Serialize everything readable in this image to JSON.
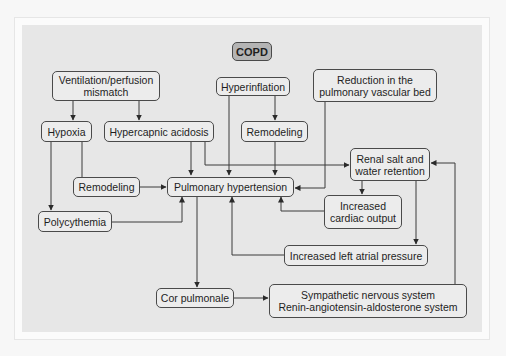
{
  "diagram": {
    "title": "COPD",
    "nodes": {
      "copd": {
        "label": "COPD"
      },
      "vq": {
        "line1": "Ventilation/perfusion",
        "line2": "mismatch"
      },
      "hyperinflation": {
        "label": "Hyperinflation"
      },
      "reduction": {
        "line1": "Reduction in the",
        "line2": "pulmonary vascular bed"
      },
      "hypoxia": {
        "label": "Hypoxia"
      },
      "hypercapnic": {
        "label": "Hypercapnic acidosis"
      },
      "remodeling_top": {
        "label": "Remodeling"
      },
      "renal": {
        "line1": "Renal salt and",
        "line2": "water retention"
      },
      "remodeling_left": {
        "label": "Remodeling"
      },
      "pulm_htn": {
        "label": "Pulmonary hypertension"
      },
      "cardiac_output": {
        "line1": "Increased",
        "line2": "cardiac output"
      },
      "polycythemia": {
        "label": "Polycythemia"
      },
      "lap": {
        "label": "Increased left atrial pressure"
      },
      "cor_pulmonale": {
        "label": "Cor pulmonale"
      },
      "sns_raas": {
        "line1": "Sympathetic nervous system",
        "line2": "Renin-angiotensin-aldosterone system"
      }
    },
    "edges": [
      {
        "from": "Ventilation/perfusion mismatch",
        "to": "Hypoxia"
      },
      {
        "from": "Ventilation/perfusion mismatch",
        "to": "Hypercapnic acidosis"
      },
      {
        "from": "Hyperinflation",
        "to": "Remodeling"
      },
      {
        "from": "Hyperinflation",
        "to": "Pulmonary hypertension"
      },
      {
        "from": "Hypoxia",
        "to": "Remodeling"
      },
      {
        "from": "Hypoxia",
        "to": "Polycythemia"
      },
      {
        "from": "Hypercapnic acidosis",
        "to": "Pulmonary hypertension"
      },
      {
        "from": "Hypercapnic acidosis",
        "to": "Renal salt and water retention"
      },
      {
        "from": "Remodeling",
        "to": "Pulmonary hypertension"
      },
      {
        "from": "Reduction in the pulmonary vascular bed",
        "to": "Pulmonary hypertension"
      },
      {
        "from": "Remodeling (left)",
        "to": "Pulmonary hypertension"
      },
      {
        "from": "Polycythemia",
        "to": "Pulmonary hypertension"
      },
      {
        "from": "Renal salt and water retention",
        "to": "Increased cardiac output"
      },
      {
        "from": "Renal salt and water retention",
        "to": "Increased left atrial pressure"
      },
      {
        "from": "Increased cardiac output",
        "to": "Pulmonary hypertension"
      },
      {
        "from": "Increased left atrial pressure",
        "to": "Pulmonary hypertension"
      },
      {
        "from": "Pulmonary hypertension",
        "to": "Cor pulmonale"
      },
      {
        "from": "Cor pulmonale",
        "to": "Sympathetic nervous system / RAAS"
      },
      {
        "from": "Sympathetic nervous system / RAAS",
        "to": "Renal salt and water retention"
      }
    ],
    "colors": {
      "background": "#e7e7e7",
      "node_fill": "#ececec",
      "title_fill": "#b4b4b4",
      "stroke": "#333333"
    }
  }
}
